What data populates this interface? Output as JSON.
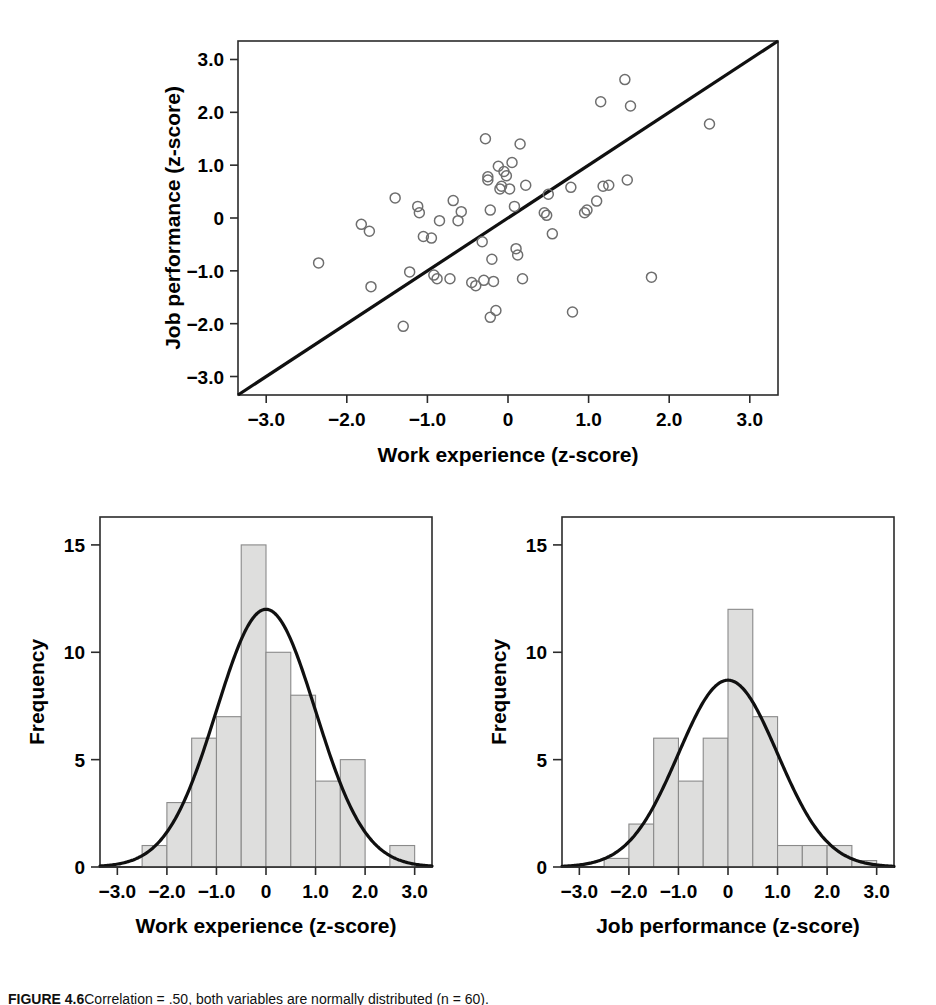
{
  "figure": {
    "caption_label": "FIGURE 4.6",
    "caption_body": "Correlation = .50, both variables are normally distributed (n = 60)."
  },
  "chart_data": [
    {
      "id": "scatter",
      "type": "scatter",
      "title": "",
      "xlabel": "Work experience (z-score)",
      "ylabel": "Job performance (z-score)",
      "xlim": [
        -3.35,
        3.35
      ],
      "ylim": [
        -3.35,
        3.35
      ],
      "xticks": [
        -3,
        -2,
        -1,
        0,
        1,
        2,
        3
      ],
      "xticklabels": [
        "-3.0",
        "-2.0",
        "-1.0",
        "0",
        "1.0",
        "2.0",
        "3.0"
      ],
      "yticks": [
        -3,
        -2,
        -1,
        0,
        1,
        2,
        3
      ],
      "yticklabels": [
        "-3.0",
        "-2.0",
        "-1.0",
        "0",
        "1.0",
        "2.0",
        "3.0"
      ],
      "grid": false,
      "reference_line": {
        "label": "identity line",
        "slope": 1,
        "intercept": 0
      },
      "marker": {
        "shape": "open-circle",
        "radius": 5,
        "color": "#6e6e6e"
      },
      "n": 60,
      "correlation": 0.5,
      "points": [
        [
          -2.35,
          -0.85
        ],
        [
          -1.82,
          -0.12
        ],
        [
          -1.72,
          -0.25
        ],
        [
          -1.7,
          -1.3
        ],
        [
          -1.4,
          0.38
        ],
        [
          -1.3,
          -2.05
        ],
        [
          -1.22,
          -1.02
        ],
        [
          -1.12,
          0.22
        ],
        [
          -1.1,
          0.1
        ],
        [
          -1.05,
          -0.35
        ],
        [
          -0.95,
          -0.38
        ],
        [
          -0.92,
          -1.08
        ],
        [
          -0.88,
          -1.15
        ],
        [
          -0.85,
          -0.05
        ],
        [
          -0.72,
          -1.15
        ],
        [
          -0.68,
          0.33
        ],
        [
          -0.62,
          -0.05
        ],
        [
          -0.58,
          0.12
        ],
        [
          -0.45,
          -1.22
        ],
        [
          -0.4,
          -1.28
        ],
        [
          -0.32,
          -0.45
        ],
        [
          -0.3,
          -1.18
        ],
        [
          -0.28,
          1.5
        ],
        [
          -0.25,
          0.78
        ],
        [
          -0.25,
          0.72
        ],
        [
          -0.22,
          0.15
        ],
        [
          -0.22,
          -1.88
        ],
        [
          -0.2,
          -0.78
        ],
        [
          -0.18,
          -1.2
        ],
        [
          -0.15,
          -1.75
        ],
        [
          -0.12,
          0.98
        ],
        [
          -0.1,
          0.55
        ],
        [
          -0.08,
          0.6
        ],
        [
          -0.05,
          0.88
        ],
        [
          -0.02,
          0.8
        ],
        [
          0.02,
          0.55
        ],
        [
          0.05,
          1.05
        ],
        [
          0.08,
          0.22
        ],
        [
          0.1,
          -0.58
        ],
        [
          0.12,
          -0.7
        ],
        [
          0.15,
          1.4
        ],
        [
          0.18,
          -1.15
        ],
        [
          0.22,
          0.62
        ],
        [
          0.45,
          0.1
        ],
        [
          0.48,
          0.05
        ],
        [
          0.5,
          0.45
        ],
        [
          0.55,
          -0.3
        ],
        [
          0.78,
          0.58
        ],
        [
          0.8,
          -1.78
        ],
        [
          0.95,
          0.1
        ],
        [
          0.98,
          0.15
        ],
        [
          1.1,
          0.32
        ],
        [
          1.15,
          2.2
        ],
        [
          1.18,
          0.6
        ],
        [
          1.25,
          0.62
        ],
        [
          1.45,
          2.62
        ],
        [
          1.48,
          0.72
        ],
        [
          1.52,
          2.12
        ],
        [
          1.78,
          -1.12
        ],
        [
          2.5,
          1.78
        ]
      ]
    },
    {
      "id": "hist_work_experience",
      "type": "bar",
      "title": "",
      "xlabel": "Work experience (z-score)",
      "ylabel": "Frequency",
      "xlim": [
        -3.35,
        3.35
      ],
      "ylim": [
        0,
        16.3
      ],
      "xticks": [
        -3,
        -2,
        -1,
        0,
        1,
        2,
        3
      ],
      "xticklabels": [
        "-3.0",
        "-2.0",
        "-1.0",
        "0",
        "1.0",
        "2.0",
        "3.0"
      ],
      "yticks": [
        0,
        5,
        10,
        15
      ],
      "yticklabels": [
        "0",
        "5",
        "10",
        "15"
      ],
      "grid": false,
      "bin_width": 0.5,
      "bin_edges": [
        -2.5,
        -2.0,
        -1.5,
        -1.0,
        -0.5,
        0.0,
        0.5,
        1.0,
        1.5,
        2.0,
        2.5,
        3.0
      ],
      "bin_centers": [
        -2.25,
        -1.75,
        -1.25,
        -0.75,
        -0.25,
        0.25,
        0.75,
        1.25,
        1.75,
        2.25,
        2.75
      ],
      "values": [
        1,
        3,
        6,
        7,
        15,
        10,
        8,
        4,
        5,
        0,
        1
      ],
      "overlay": {
        "type": "normal-curve",
        "label": "normal curve",
        "mean": 0.0,
        "sd": 1.0,
        "peak_frequency": 12.0
      }
    },
    {
      "id": "hist_job_performance",
      "type": "bar",
      "title": "",
      "xlabel": "Job performance (z-score)",
      "ylabel": "Frequency",
      "xlim": [
        -3.35,
        3.35
      ],
      "ylim": [
        0,
        16.3
      ],
      "xticks": [
        -3,
        -2,
        -1,
        0,
        1,
        2,
        3
      ],
      "xticklabels": [
        "-3.0",
        "-2.0",
        "-1.0",
        "0",
        "1.0",
        "2.0",
        "3.0"
      ],
      "yticks": [
        0,
        5,
        10,
        15
      ],
      "yticklabels": [
        "0",
        "5",
        "10",
        "15"
      ],
      "grid": false,
      "bin_width": 0.5,
      "bin_edges": [
        -2.5,
        -2.0,
        -1.5,
        -1.0,
        -0.5,
        0.0,
        0.5,
        1.0,
        1.5,
        2.0,
        2.5,
        3.0
      ],
      "bin_centers": [
        -2.25,
        -1.75,
        -1.25,
        -0.75,
        -0.25,
        0.25,
        0.75,
        1.25,
        1.75,
        2.25,
        2.75
      ],
      "values": [
        0.4,
        2,
        6,
        4,
        6,
        12,
        7,
        1,
        1,
        1,
        0.3
      ],
      "overlay": {
        "type": "normal-curve",
        "label": "normal curve",
        "mean": 0.0,
        "sd": 1.0,
        "peak_frequency": 8.7
      }
    }
  ]
}
